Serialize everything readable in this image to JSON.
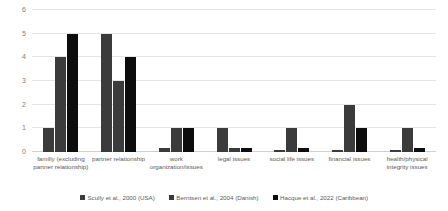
{
  "chart_data": {
    "type": "bar",
    "title": "",
    "subtitle": "",
    "xlabel": "",
    "ylabel": "",
    "ylim": [
      0,
      6
    ],
    "yticks": [
      0,
      1,
      2,
      3,
      4,
      5,
      6
    ],
    "ytick_labels": [
      "0",
      "1",
      "2",
      "3",
      "4",
      "5",
      "6"
    ],
    "grid": true,
    "legend_position": "bottom",
    "categories": [
      "familly (excluding partner relationship)",
      "partner relationship",
      "work organization/issues",
      "legal issues",
      "social life issues",
      "financial issues",
      "health/physical integrity issues"
    ],
    "series": [
      {
        "name": "Scully et al., 2000 (USA)",
        "color": "#3b3b3b",
        "values": [
          1,
          5,
          0.15,
          1,
          0.1,
          0.1,
          0.1
        ]
      },
      {
        "name": "Berntsen et al., 2004 (Danish)",
        "color": "#3b3b3b",
        "values": [
          4,
          3,
          1,
          0.15,
          1,
          2,
          1
        ]
      },
      {
        "name": "Hacque et al., 2022 (Caribbean)",
        "color": "#0d0d0d",
        "values": [
          5,
          4,
          1,
          0.15,
          0.15,
          1,
          0.15
        ]
      }
    ]
  },
  "colors": {
    "gridline": "#e4e4e4",
    "axis": "#d0d0d0",
    "tick_text": "#808080",
    "label_text": "#5a5a5a",
    "background": "#ffffff"
  }
}
